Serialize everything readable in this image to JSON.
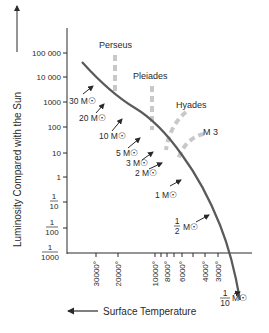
{
  "diagram": {
    "y_axis": {
      "label": "Luminosity Compared with the Sun",
      "ticks": [
        {
          "label": "100 000",
          "y": 53
        },
        {
          "label": "10 000",
          "y": 77
        },
        {
          "label": "1000",
          "y": 102
        },
        {
          "label": "100",
          "y": 127
        },
        {
          "label": "10",
          "y": 153
        },
        {
          "label": "1",
          "y": 177
        },
        {
          "label_num": "1",
          "label_den": "10",
          "y": 202
        },
        {
          "label_num": "1",
          "label_den": "100",
          "y": 228
        },
        {
          "label_num": "1",
          "label_den": "1000",
          "y": 253
        }
      ]
    },
    "x_axis": {
      "label": "Surface Temperature",
      "ticks": [
        {
          "label": "30000°",
          "x": 96
        },
        {
          "label": "20000°",
          "x": 118
        },
        {
          "label": "10000°",
          "x": 155
        },
        {
          "label": "",
          "x": 161
        },
        {
          "label": "8000°",
          "x": 167
        },
        {
          "label": "",
          "x": 174
        },
        {
          "label": "6000°",
          "x": 182
        },
        {
          "label": "",
          "x": 193
        },
        {
          "label": "4000°",
          "x": 205
        },
        {
          "label": "3000°",
          "x": 218
        }
      ]
    },
    "clusters": [
      {
        "name": "Perseus"
      },
      {
        "name": "Pleiades"
      },
      {
        "name": "Hyades"
      },
      {
        "name": "M 3"
      }
    ],
    "masses": [
      {
        "label": "30 M☉"
      },
      {
        "label": "20 M☉"
      },
      {
        "label": "10 M☉"
      },
      {
        "label": "5 M☉"
      },
      {
        "label": "3 M☉"
      },
      {
        "label": "2 M☉"
      },
      {
        "label": "1 M☉"
      },
      {
        "num": "1",
        "den": "2",
        "suffix": "M☉"
      },
      {
        "num": "1",
        "den": "10",
        "suffix": "M☉"
      }
    ],
    "colors": {
      "ink": "#2a2a2a",
      "main_sequence": "#5a5a5a",
      "cluster_dash": "#c8c8c8"
    }
  }
}
